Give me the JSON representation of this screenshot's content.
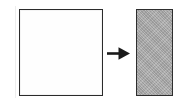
{
  "figure": {
    "caption": "",
    "background_color": "#ffffff",
    "width": 186,
    "height": 109
  },
  "shapes": {
    "source": {
      "name": "square",
      "label": "",
      "fill_color": "#fefefe",
      "stroke_color": "#2b2b2b",
      "width": 84,
      "height": 87
    },
    "result": {
      "name": "rectangle",
      "label": "",
      "fill_color": "#a8a8a8",
      "stroke_color": "#2e2e2e",
      "width": 37,
      "height": 87
    }
  },
  "arrow": {
    "name": "right-arrow",
    "direction": "right",
    "color": "#1a1a1a",
    "label": ""
  }
}
